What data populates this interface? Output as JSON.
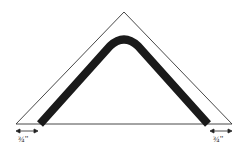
{
  "diagram": {
    "left_dimension": "¾\"",
    "right_dimension": "¾\"",
    "colors": {
      "outline": "#333333",
      "band": "#1a1a1a",
      "background": "#ffffff"
    }
  }
}
